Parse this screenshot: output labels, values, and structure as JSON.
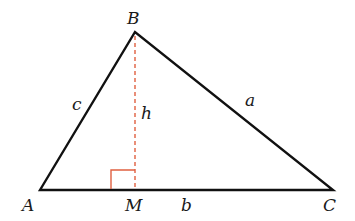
{
  "diagram": {
    "vertices": {
      "A": {
        "label": "A",
        "x": 40,
        "y": 190
      },
      "B": {
        "label": "B",
        "x": 135,
        "y": 32
      },
      "C": {
        "label": "C",
        "x": 333,
        "y": 190
      },
      "M": {
        "label": "M",
        "x": 135,
        "y": 190
      }
    },
    "sides": {
      "a": "a",
      "b": "b",
      "c": "c"
    },
    "altitude": {
      "label": "h",
      "style": "dashed",
      "color": "#e06040"
    },
    "right_angle_marker_color": "#e06040",
    "line_color": "#111111"
  }
}
